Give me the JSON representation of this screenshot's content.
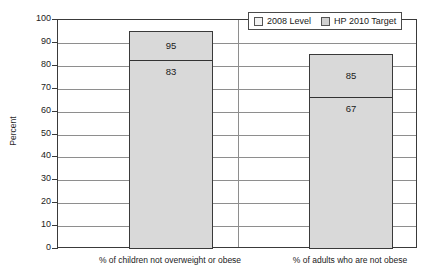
{
  "chart_data": {
    "type": "bar",
    "title": "",
    "xlabel": "",
    "ylabel": "Percent",
    "ylim": [
      0,
      100
    ],
    "ytick_values": [
      0,
      10,
      20,
      30,
      40,
      50,
      60,
      70,
      80,
      90,
      100
    ],
    "ytick_labels": [
      "0",
      "10",
      "20",
      "30",
      "40",
      "50",
      "60",
      "70",
      "80",
      "90",
      "100"
    ],
    "grid": true,
    "stacked_overlay": true,
    "legend_position": "top-right",
    "categories": [
      "% of children not overweight or obese",
      "% of adults who are not obese"
    ],
    "series": [
      {
        "name": "2008 Level",
        "color": "#d9d9d9",
        "values": [
          83,
          67
        ],
        "value_labels": [
          "83",
          "67"
        ]
      },
      {
        "name": "HP 2010 Target",
        "color": "#d9d9d9",
        "values": [
          95,
          85
        ],
        "value_labels": [
          "95",
          "85"
        ]
      }
    ]
  },
  "axis": {
    "y_title": "Percent"
  },
  "legend": {
    "items": [
      {
        "label": "2008 Level",
        "swatch_color": "#f2f2f2"
      },
      {
        "label": "HP 2010 Target",
        "swatch_color": "#d0d0d0"
      }
    ]
  },
  "colors": {
    "bar_fill": "#d9d9d9",
    "bar_border": "#3a3a3a",
    "gridline": "#8e8e8e",
    "axis": "#3a3a3a",
    "text": "#1a1a1a",
    "background": "#ffffff"
  }
}
